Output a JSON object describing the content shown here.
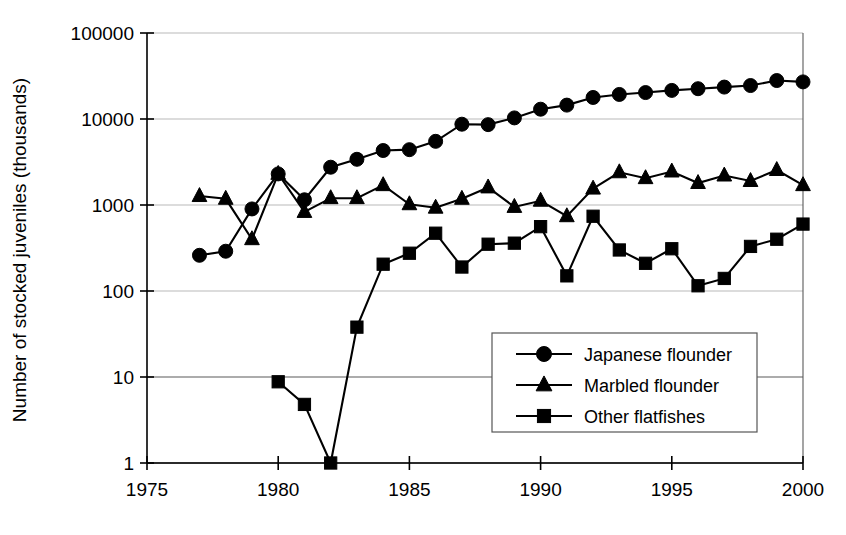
{
  "chart_data": {
    "type": "line",
    "title": "",
    "xlabel": "",
    "ylabel": "Number of stocked juveniles (thousands)",
    "xlim": [
      1975,
      2000
    ],
    "ylim": [
      1,
      100000
    ],
    "yscale": "log",
    "grid": true,
    "legend_position": "inside-lower-right",
    "xticks": [
      "1975",
      "1980",
      "1985",
      "1990",
      "1995",
      "2000"
    ],
    "xtick_values": [
      1975,
      1980,
      1985,
      1990,
      1995,
      2000
    ],
    "yticks": [
      "1",
      "10",
      "100",
      "1000",
      "10000",
      "100000"
    ],
    "ytick_values": [
      1,
      10,
      100,
      1000,
      10000,
      100000
    ],
    "x": [
      1977,
      1978,
      1979,
      1980,
      1981,
      1982,
      1983,
      1984,
      1985,
      1986,
      1987,
      1988,
      1989,
      1990,
      1991,
      1992,
      1993,
      1994,
      1995,
      1996,
      1997,
      1998,
      1999,
      2000
    ],
    "series": [
      {
        "name": "Japanese flounder",
        "marker": "circle",
        "x": [
          1977,
          1978,
          1979,
          1980,
          1981,
          1982,
          1983,
          1984,
          1985,
          1986,
          1987,
          1988,
          1989,
          1990,
          1991,
          1992,
          1993,
          1994,
          1995,
          1996,
          1997,
          1998,
          1999,
          2000
        ],
        "values": [
          260,
          290,
          900,
          2300,
          1150,
          2750,
          3400,
          4300,
          4400,
          5500,
          8700,
          8600,
          10300,
          13000,
          14500,
          17800,
          19300,
          20300,
          21500,
          22500,
          23500,
          24500,
          28000,
          27000
        ]
      },
      {
        "name": "Marbled flounder",
        "marker": "triangle",
        "x": [
          1977,
          1978,
          1979,
          1980,
          1981,
          1982,
          1983,
          1984,
          1985,
          1986,
          1987,
          1988,
          1989,
          1990,
          1991,
          1992,
          1993,
          1994,
          1995,
          1996,
          1997,
          1998,
          1999,
          2000
        ],
        "values": [
          1270,
          1180,
          400,
          2300,
          830,
          1200,
          1200,
          1700,
          1020,
          930,
          1180,
          1600,
          950,
          1120,
          740,
          1550,
          2400,
          2050,
          2450,
          1800,
          2200,
          1900,
          2550,
          1700
        ]
      },
      {
        "name": "Other flatfishes",
        "marker": "square",
        "x": [
          1980,
          1981,
          1982,
          1983,
          1984,
          1985,
          1986,
          1987,
          1988,
          1989,
          1990,
          1991,
          1992,
          1993,
          1994,
          1995,
          1996,
          1997,
          1998,
          1999,
          2000
        ],
        "values": [
          8.8,
          4.8,
          1.0,
          38,
          205,
          275,
          470,
          190,
          350,
          360,
          560,
          150,
          740,
          300,
          210,
          310,
          115,
          140,
          330,
          400,
          600
        ]
      }
    ]
  },
  "legend": {
    "entries": [
      {
        "label": "Japanese flounder",
        "marker": "circle"
      },
      {
        "label": "Marbled flounder",
        "marker": "triangle"
      },
      {
        "label": "Other flatfishes",
        "marker": "square"
      }
    ]
  }
}
